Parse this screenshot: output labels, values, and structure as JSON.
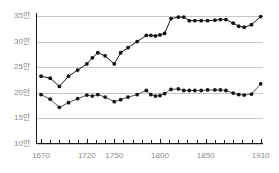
{
  "chart_data": {
    "type": "line",
    "title": "",
    "subtitle": "",
    "xlabel": "",
    "ylabel": "",
    "grid": true,
    "legend_position": "none",
    "xlim": [
      1665,
      1912
    ],
    "ylim": [
      100000,
      355000
    ],
    "y_unit_label": "만",
    "y_unit_value": 10000,
    "y_ticks": [
      100000,
      150000,
      200000,
      250000,
      300000,
      350000
    ],
    "y_tick_labels": [
      "10만",
      "15만",
      "20만",
      "25만",
      "30만",
      "35만"
    ],
    "x_ticks": [
      1670,
      1720,
      1750,
      1800,
      1850,
      1910
    ],
    "x_tick_labels": [
      "1670",
      "1720",
      "1750",
      "1800",
      "1850",
      "1910"
    ],
    "x_minor_tick_step": 10,
    "series": [
      {
        "name": "upper-series",
        "color": "#1a1a1a",
        "marker": "circle",
        "x": [
          1670,
          1680,
          1690,
          1700,
          1710,
          1720,
          1726,
          1732,
          1740,
          1750,
          1757,
          1765,
          1775,
          1785,
          1790,
          1795,
          1800,
          1805,
          1812,
          1820,
          1826,
          1832,
          1838,
          1845,
          1852,
          1860,
          1866,
          1872,
          1880,
          1886,
          1892,
          1900,
          1910
        ],
        "values": [
          232000,
          228000,
          212000,
          232000,
          244000,
          256000,
          268000,
          278000,
          272000,
          256000,
          278000,
          288000,
          300000,
          312000,
          312000,
          311000,
          313000,
          316000,
          345000,
          348000,
          348000,
          341000,
          341000,
          341000,
          341000,
          342000,
          343000,
          343000,
          336000,
          330000,
          328000,
          333000,
          349000
        ]
      },
      {
        "name": "lower-series",
        "color": "#555555",
        "marker": "circle",
        "x": [
          1670,
          1680,
          1690,
          1700,
          1710,
          1720,
          1726,
          1732,
          1740,
          1750,
          1757,
          1765,
          1775,
          1785,
          1790,
          1795,
          1800,
          1805,
          1812,
          1820,
          1826,
          1832,
          1838,
          1845,
          1852,
          1860,
          1866,
          1872,
          1880,
          1886,
          1892,
          1900,
          1910
        ],
        "values": [
          196000,
          187000,
          171000,
          180000,
          188000,
          195000,
          193000,
          196000,
          191000,
          182000,
          186000,
          191000,
          196000,
          204000,
          196000,
          193000,
          194000,
          198000,
          206000,
          207000,
          204000,
          204000,
          204000,
          204000,
          205000,
          205000,
          205000,
          204000,
          199000,
          196000,
          195000,
          197000,
          217000
        ]
      }
    ]
  },
  "axes": {
    "axis_color": "#1a1a1a",
    "grid_color": "#c8c8c8",
    "tick_text_color": "#8a8a8a"
  }
}
